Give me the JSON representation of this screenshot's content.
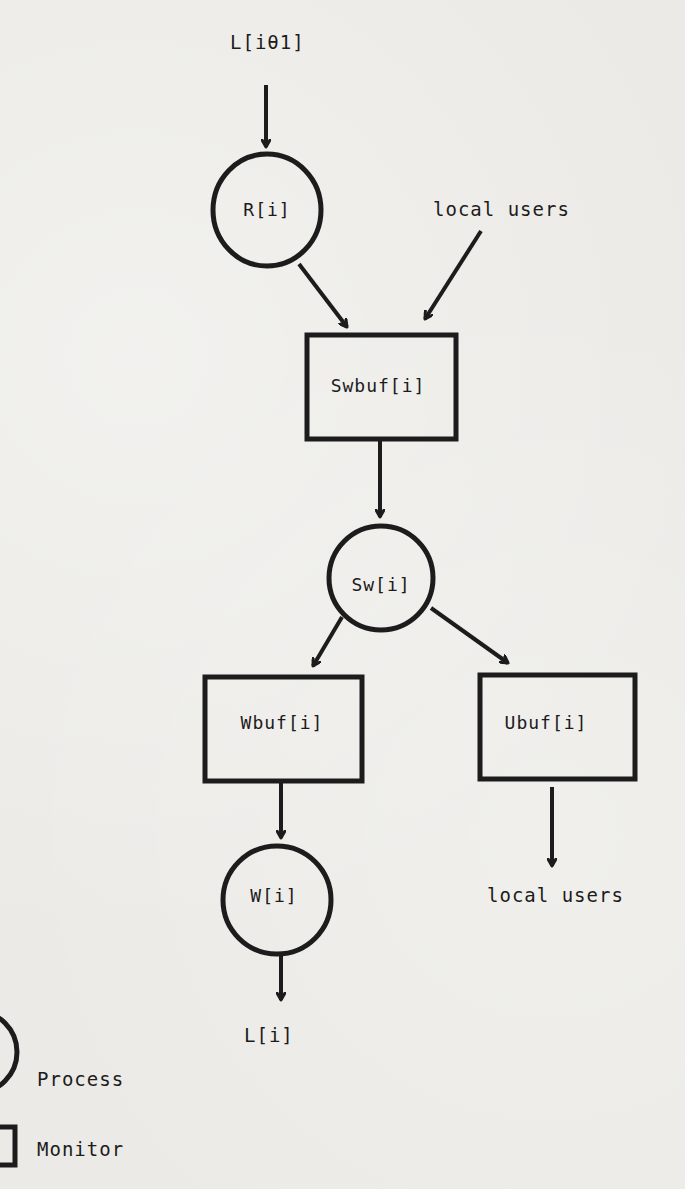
{
  "diagram": {
    "nodes": {
      "input_link": {
        "label": "L[iθ1]",
        "kind": "terminal"
      },
      "reader": {
        "label": "R[i]",
        "kind": "process"
      },
      "local_users_in": {
        "label": "local users",
        "kind": "terminal"
      },
      "swbuf": {
        "label": "Swbuf[i]",
        "kind": "monitor"
      },
      "switch": {
        "label": "Sw[i]",
        "kind": "process"
      },
      "wbuf": {
        "label": "Wbuf[i]",
        "kind": "monitor"
      },
      "ubuf": {
        "label": "Ubuf[i]",
        "kind": "monitor"
      },
      "writer": {
        "label": "W[i]",
        "kind": "process"
      },
      "local_users_out": {
        "label": "local users",
        "kind": "terminal"
      },
      "output_link": {
        "label": "L[i]",
        "kind": "terminal"
      }
    },
    "edges": [
      {
        "from": "L[iθ1]",
        "to": "R[i]"
      },
      {
        "from": "R[i]",
        "to": "Swbuf[i]"
      },
      {
        "from": "local users",
        "to": "Swbuf[i]"
      },
      {
        "from": "Swbuf[i]",
        "to": "Sw[i]"
      },
      {
        "from": "Sw[i]",
        "to": "Wbuf[i]"
      },
      {
        "from": "Sw[i]",
        "to": "Ubuf[i]"
      },
      {
        "from": "Wbuf[i]",
        "to": "W[i]"
      },
      {
        "from": "Ubuf[i]",
        "to": "local users"
      },
      {
        "from": "W[i]",
        "to": "L[i]"
      }
    ],
    "legend": {
      "process": {
        "label": "Process",
        "shape": "circle"
      },
      "monitor": {
        "label": "Monitor",
        "shape": "rectangle"
      }
    },
    "colors": {
      "ink": "#1c1c1c",
      "paper": "#ebeae6"
    }
  }
}
